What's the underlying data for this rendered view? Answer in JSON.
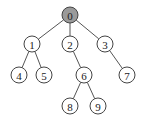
{
  "diagram": {
    "type": "tree",
    "root": "0",
    "highlight_color": "#9a9a9a",
    "node_fill": "#ffffff",
    "nodes": [
      {
        "id": "0",
        "label": "0",
        "x": 70,
        "y": 15,
        "highlighted": true
      },
      {
        "id": "1",
        "label": "1",
        "x": 32,
        "y": 44,
        "highlighted": false
      },
      {
        "id": "2",
        "label": "2",
        "x": 70,
        "y": 44,
        "highlighted": false
      },
      {
        "id": "3",
        "label": "3",
        "x": 105,
        "y": 44,
        "highlighted": false
      },
      {
        "id": "4",
        "label": "4",
        "x": 19,
        "y": 75,
        "highlighted": false
      },
      {
        "id": "5",
        "label": "5",
        "x": 44,
        "y": 75,
        "highlighted": false
      },
      {
        "id": "6",
        "label": "6",
        "x": 84,
        "y": 75,
        "highlighted": false
      },
      {
        "id": "7",
        "label": "7",
        "x": 127,
        "y": 75,
        "highlighted": false
      },
      {
        "id": "8",
        "label": "8",
        "x": 70,
        "y": 106,
        "highlighted": false
      },
      {
        "id": "9",
        "label": "9",
        "x": 98,
        "y": 106,
        "highlighted": false
      }
    ],
    "edges": [
      [
        "0",
        "1"
      ],
      [
        "0",
        "2"
      ],
      [
        "0",
        "3"
      ],
      [
        "1",
        "4"
      ],
      [
        "1",
        "5"
      ],
      [
        "2",
        "6"
      ],
      [
        "3",
        "7"
      ],
      [
        "6",
        "8"
      ],
      [
        "6",
        "9"
      ]
    ]
  }
}
